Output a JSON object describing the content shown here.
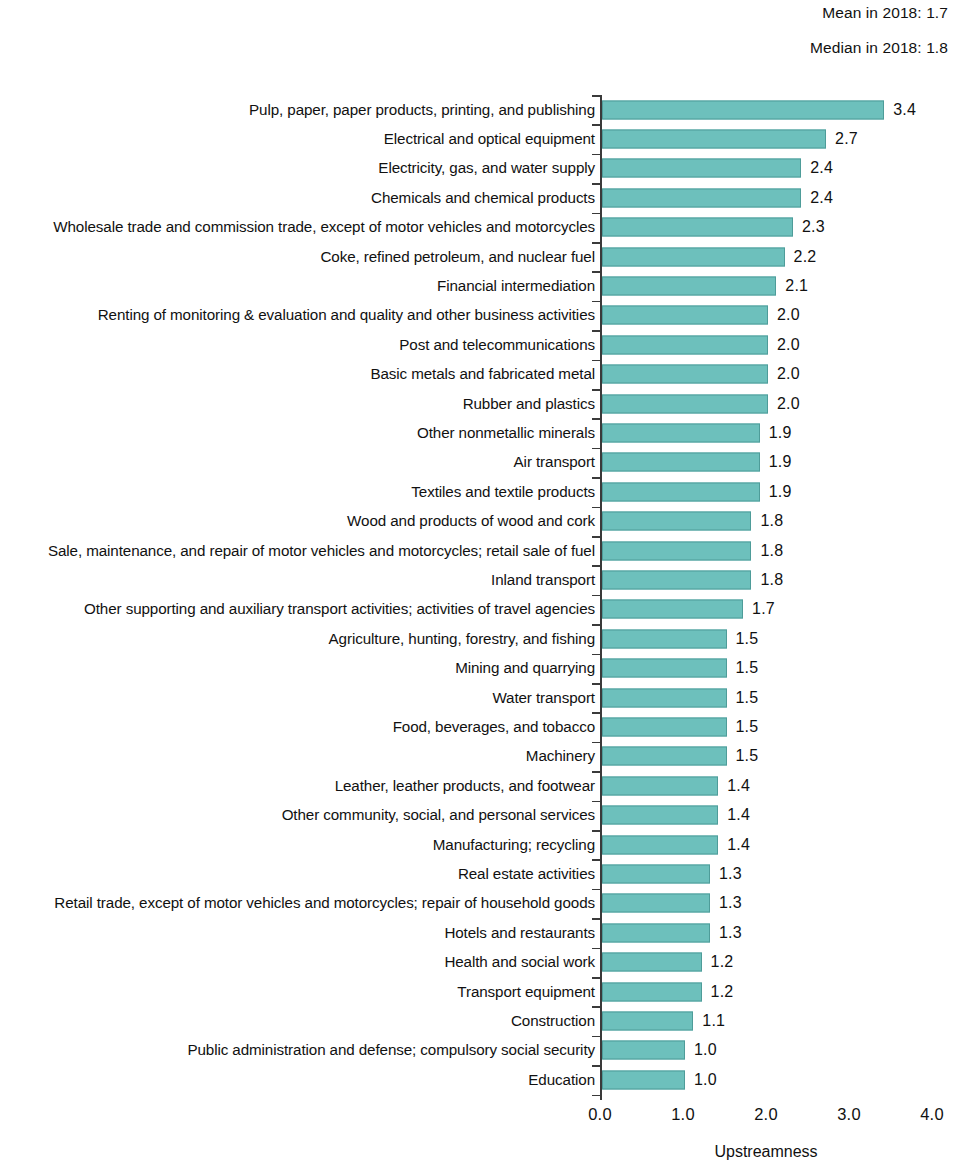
{
  "header": {
    "mean_note": "Mean in 2018: 1.7",
    "median_note": "Median in 2018: 1.8"
  },
  "axis": {
    "x_title": "Upstreamness",
    "ticks": [
      "0.0",
      "1.0",
      "2.0",
      "3.0",
      "4.0"
    ]
  },
  "chart_data": {
    "type": "bar",
    "orientation": "horizontal",
    "title": "",
    "subtitle": "",
    "xlabel": "Upstreamness",
    "ylabel": "",
    "xlim": [
      0.0,
      4.0
    ],
    "xticks": [
      0.0,
      1.0,
      2.0,
      3.0,
      4.0
    ],
    "grid": false,
    "legend": false,
    "bar_color": "#6dc0bc",
    "annotations": [
      "Mean in 2018: 1.7",
      "Median in 2018: 1.8"
    ],
    "categories": [
      "Pulp, paper, paper products, printing, and publishing",
      "Electrical and optical equipment",
      "Electricity, gas, and water supply",
      "Chemicals and chemical products",
      "Wholesale trade and commission trade, except of motor vehicles and motorcycles",
      "Coke, refined petroleum, and nuclear fuel",
      "Financial intermediation",
      "Renting of monitoring & evaluation and quality and other business activities",
      "Post and telecommunications",
      "Basic metals and fabricated metal",
      "Rubber and plastics",
      "Other nonmetallic minerals",
      "Air transport",
      "Textiles and textile products",
      "Wood and products of wood and cork",
      "Sale, maintenance, and repair of motor vehicles and motorcycles; retail sale of fuel",
      "Inland transport",
      "Other supporting and auxiliary transport activities; activities of travel agencies",
      "Agriculture, hunting, forestry, and fishing",
      "Mining and quarrying",
      "Water transport",
      "Food, beverages, and tobacco",
      "Machinery",
      "Leather, leather products, and footwear",
      "Other community, social, and personal services",
      "Manufacturing; recycling",
      "Real estate activities",
      "Retail trade, except of motor vehicles and motorcycles; repair of household goods",
      "Hotels and restaurants",
      "Health and social work",
      "Transport equipment",
      "Construction",
      "Public administration and defense; compulsory social security",
      "Education"
    ],
    "values": [
      3.4,
      2.7,
      2.4,
      2.4,
      2.3,
      2.2,
      2.1,
      2.0,
      2.0,
      2.0,
      2.0,
      1.9,
      1.9,
      1.9,
      1.8,
      1.8,
      1.8,
      1.7,
      1.5,
      1.5,
      1.5,
      1.5,
      1.5,
      1.4,
      1.4,
      1.4,
      1.3,
      1.3,
      1.3,
      1.2,
      1.2,
      1.1,
      1.0,
      1.0
    ],
    "value_labels": [
      "3.4",
      "2.7",
      "2.4",
      "2.4",
      "2.3",
      "2.2",
      "2.1",
      "2.0",
      "2.0",
      "2.0",
      "2.0",
      "1.9",
      "1.9",
      "1.9",
      "1.8",
      "1.8",
      "1.8",
      "1.7",
      "1.5",
      "1.5",
      "1.5",
      "1.5",
      "1.5",
      "1.4",
      "1.4",
      "1.4",
      "1.3",
      "1.3",
      "1.3",
      "1.2",
      "1.2",
      "1.1",
      "1.0",
      "1.0"
    ]
  }
}
